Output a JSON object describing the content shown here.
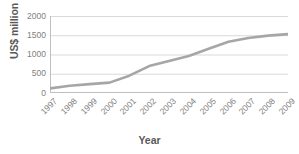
{
  "chart_data": {
    "type": "line",
    "title": "",
    "subtitle": "",
    "xlabel": "Year",
    "ylabel": "US$ million",
    "categories": [
      "1997",
      "1998",
      "1999",
      "2000",
      "2001",
      "2002",
      "2003",
      "2004",
      "2005",
      "2006",
      "2007",
      "2008",
      "2009"
    ],
    "values": [
      120,
      190,
      230,
      270,
      450,
      700,
      830,
      960,
      1150,
      1330,
      1430,
      1490,
      1530
    ],
    "series": [
      {
        "name": "US$ million",
        "values": [
          120,
          190,
          230,
          270,
          450,
          700,
          830,
          960,
          1150,
          1330,
          1430,
          1490,
          1530
        ]
      }
    ],
    "ylim": [
      0,
      2000
    ],
    "yticks": [
      0,
      500,
      1000,
      1500,
      2000
    ],
    "ytick_labels": [
      "0",
      "500",
      "1000",
      "1500",
      "2000"
    ],
    "xtick_labels": [
      "1997",
      "1998",
      "1999",
      "2000",
      "2001",
      "2002",
      "2003",
      "2004",
      "2005",
      "2006",
      "2007",
      "2008",
      "2009"
    ],
    "grid": "horizontal",
    "legend": "none",
    "legend_position": "none",
    "line_color": "#a6a6a6",
    "grid_color": "#d9d9d9",
    "axis_color": "#bfbfbf",
    "label_color": "#808080",
    "title_color": "#595959",
    "background": "#ffffff",
    "xtick_rotation": -45,
    "line_width": 2.6,
    "markers": false
  }
}
